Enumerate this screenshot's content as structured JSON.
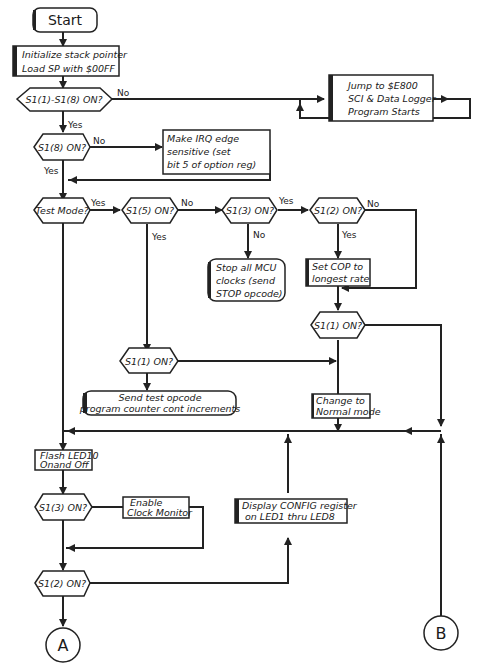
{
  "diagram": {
    "type": "flowchart",
    "start": {
      "label": "Start"
    },
    "nodes": {
      "init": {
        "line1": "Initialize stack pointer",
        "line2": "Load SP with $00FF"
      },
      "d_all": {
        "label": "S1(1)-S1(8) ON?"
      },
      "jump": {
        "line1": "Jump to $E800",
        "line2": "SCI & Data Logger",
        "line3": "Program Starts"
      },
      "d_s18": {
        "label": "S1(8) ON?"
      },
      "irq": {
        "line1": "Make IRQ edge",
        "line2": "sensitive (set",
        "line3": "bit 5 of option reg)"
      },
      "d_test": {
        "label": "Test Mode?"
      },
      "d_s15": {
        "label": "S1(5) ON?"
      },
      "d_s13a": {
        "label": "S1(3) ON?"
      },
      "d_s12a": {
        "label": "S1(2) ON?"
      },
      "stop": {
        "line1": "Stop all MCU",
        "line2": "clocks (send",
        "line3": "STOP opcode)"
      },
      "cop": {
        "line1": "Set COP to",
        "line2": "longest rate"
      },
      "d_s11a": {
        "label": "S1(1) ON?"
      },
      "d_s11b": {
        "label": "S1(1) ON?"
      },
      "testop": {
        "line1": "Send test opcode",
        "line2": "program counter cont increments"
      },
      "normal": {
        "line1": "Change to",
        "line2": "Normal mode"
      },
      "flash": {
        "line1": "Flash LED10",
        "line2": "Onand Off"
      },
      "d_s13b": {
        "label": "S1(3) ON?"
      },
      "clockmon": {
        "line1": "Enable",
        "line2": "Clock Monitor"
      },
      "config": {
        "line1": "Display CONFIG register",
        "line2": "on LED1 thru LED8"
      },
      "d_s12b": {
        "label": "S1(2) ON?"
      }
    },
    "edge_labels": {
      "no": "No",
      "yes": "Yes"
    },
    "connectors": {
      "a": "A",
      "b": "B"
    }
  }
}
